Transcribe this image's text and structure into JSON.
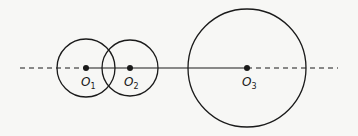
{
  "diagram": {
    "type": "collinear-circles",
    "background": "#f7f7f5",
    "stroke_color": "#1a1a1a",
    "axis": {
      "y": 68,
      "dashed_left": {
        "x1": 20,
        "x2": 86
      },
      "solid": {
        "x1": 86,
        "x2": 247
      },
      "dashed_right": {
        "x1": 247,
        "x2": 338
      }
    },
    "circles": [
      {
        "id": "c1",
        "cx": 86,
        "cy": 68,
        "r": 29,
        "center_label": "O",
        "subscript": "1"
      },
      {
        "id": "c2",
        "cx": 130,
        "cy": 68,
        "r": 28,
        "center_label": "O",
        "subscript": "2"
      },
      {
        "id": "c3",
        "cx": 247,
        "cy": 68,
        "r": 59,
        "center_label": "O",
        "subscript": "3"
      }
    ]
  }
}
